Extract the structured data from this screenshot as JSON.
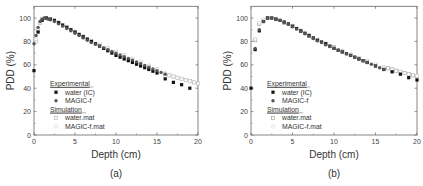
{
  "chart_data": [
    {
      "type": "scatter",
      "panel_label": "(a)",
      "title": "",
      "xlabel": "Depth (cm)",
      "ylabel": "PDD (%)",
      "xlim": [
        0,
        20
      ],
      "ylim": [
        0,
        110
      ],
      "xticks": [
        0,
        5,
        10,
        15,
        20
      ],
      "yticks": [
        0,
        20,
        40,
        60,
        80,
        100
      ],
      "grid": false,
      "legend_position": "lower left",
      "legend": {
        "groups": [
          {
            "heading": "Experimental",
            "entries": [
              "water (IC)",
              "MAGIC-f"
            ]
          },
          {
            "heading": "Simulation",
            "entries": [
              "water.mat",
              "MAGIC-f.mat"
            ]
          }
        ]
      },
      "series": [
        {
          "name": "water (IC)",
          "group": "Experimental",
          "marker": "filled-square",
          "color": "#111111",
          "x": [
            0,
            0.5,
            1,
            1.5,
            2,
            2.5,
            3,
            3.5,
            4,
            4.5,
            5,
            5.5,
            6,
            6.5,
            7,
            7.5,
            8,
            8.5,
            9,
            9.5,
            10,
            10.5,
            11,
            11.5,
            12,
            12.5,
            13,
            13.5,
            14,
            14.5,
            15,
            16,
            17,
            18,
            19
          ],
          "y": [
            55,
            88,
            98,
            100,
            99,
            98,
            96,
            94,
            92,
            90,
            88,
            86,
            84,
            82,
            80,
            78,
            76,
            74,
            72,
            70,
            68,
            66.5,
            65,
            63.5,
            62,
            60.5,
            59,
            57.5,
            56,
            54.5,
            53,
            48,
            45,
            43,
            40
          ]
        },
        {
          "name": "MAGIC-f",
          "group": "Experimental",
          "marker": "filled-circle",
          "color": "#555555",
          "x": [
            0,
            0.25,
            0.5,
            0.75,
            1,
            1.25,
            1.5,
            1.75,
            2,
            2.5,
            3,
            3.5,
            4,
            4.5,
            5,
            5.5,
            6,
            6.5,
            7,
            7.5,
            8,
            8.5,
            9,
            9.5,
            10,
            10.5,
            11,
            11.5,
            12,
            12.5,
            13,
            13.5,
            14,
            14.5,
            15,
            15.5,
            16
          ],
          "y": [
            78,
            85,
            92,
            97,
            99,
            100,
            99.5,
            99,
            98.5,
            97,
            95,
            93,
            91,
            89,
            87,
            85,
            83,
            81,
            79,
            77.5,
            76,
            74.5,
            73,
            71.5,
            70,
            68.5,
            67,
            65.5,
            64,
            62.5,
            61,
            59.5,
            58,
            56.5,
            55,
            53.5,
            52
          ]
        },
        {
          "name": "water.mat",
          "group": "Simulation",
          "marker": "open-square",
          "color": "#aaaaaa",
          "x": [
            0.25,
            0.5,
            0.75,
            1,
            1.5,
            2,
            3,
            4,
            5,
            6,
            7,
            8,
            9,
            10,
            11,
            12,
            13,
            14,
            15,
            16,
            16.5,
            17,
            17.5,
            18,
            18.5,
            19,
            19.5,
            20
          ],
          "y": [
            80,
            90,
            96,
            99,
            100,
            99,
            96,
            92,
            88,
            84,
            80,
            77,
            74,
            71,
            68,
            65,
            62,
            59,
            56,
            52,
            51,
            50,
            49,
            48,
            47,
            46,
            45,
            44
          ]
        },
        {
          "name": "MAGIC-f.mat",
          "group": "Simulation",
          "marker": "open-circle",
          "color": "#cccccc",
          "x": [
            0.25,
            0.5,
            0.75,
            1,
            1.5,
            2,
            3,
            4,
            5,
            6,
            7,
            8,
            9,
            10,
            11,
            12,
            13,
            14,
            15,
            16,
            17,
            18,
            19,
            20
          ],
          "y": [
            82,
            91,
            97,
            99.5,
            100,
            99,
            96,
            92.5,
            88.5,
            84.5,
            81,
            77.5,
            74.5,
            71.5,
            68.5,
            65.5,
            62.5,
            59.5,
            56.5,
            53,
            50,
            48,
            46,
            44
          ]
        }
      ]
    },
    {
      "type": "scatter",
      "panel_label": "(b)",
      "title": "",
      "xlabel": "Depth (cm)",
      "ylabel": "PDD (%)",
      "xlim": [
        0,
        20
      ],
      "ylim": [
        0,
        110
      ],
      "xticks": [
        0,
        5,
        10,
        15,
        20
      ],
      "yticks": [
        0,
        20,
        40,
        60,
        80,
        100
      ],
      "grid": false,
      "legend_position": "lower left",
      "legend": {
        "groups": [
          {
            "heading": "Experimental",
            "entries": [
              "water (IC)",
              "MAGIC-f"
            ]
          },
          {
            "heading": "Simulation",
            "entries": [
              "water.mat",
              "MAGIC-f.mat"
            ]
          }
        ]
      },
      "series": [
        {
          "name": "water (IC)",
          "group": "Experimental",
          "marker": "filled-square",
          "color": "#111111",
          "x": [
            0,
            0.5,
            1,
            1.5,
            2,
            2.5,
            3,
            3.5,
            4,
            4.5,
            5,
            5.5,
            6,
            6.5,
            7,
            7.5,
            8,
            8.5,
            9,
            9.5,
            10,
            10.5,
            11,
            11.5,
            12,
            12.5,
            13,
            13.5,
            14,
            15,
            16,
            17,
            18,
            19,
            20
          ],
          "y": [
            40,
            73,
            89,
            97,
            100,
            100,
            99,
            98,
            96.5,
            95,
            93,
            91,
            89,
            87,
            85,
            83,
            81,
            79.5,
            78,
            76,
            74,
            72.5,
            71,
            69.5,
            68,
            66.5,
            65,
            63.5,
            62,
            59,
            56,
            54,
            52,
            49,
            47
          ]
        },
        {
          "name": "MAGIC-f",
          "group": "Experimental",
          "marker": "filled-circle",
          "color": "#555555",
          "x": [
            0.5,
            1,
            1.5,
            2,
            2.5,
            3,
            3.5,
            4,
            4.5,
            5,
            5.5,
            6,
            6.5,
            7,
            7.5,
            8,
            8.5,
            9,
            9.5,
            10,
            10.5,
            11,
            11.5,
            12,
            12.5,
            13,
            13.5,
            14,
            14.5,
            15,
            15.5,
            16
          ],
          "y": [
            74,
            90,
            97,
            100,
            100,
            99,
            98,
            96.5,
            94.5,
            92.5,
            90.5,
            88.5,
            86.5,
            84.5,
            82.5,
            80.5,
            79,
            77,
            75.5,
            74,
            72.5,
            71,
            69.5,
            68,
            66.5,
            65,
            63.5,
            62,
            60.5,
            59,
            57.5,
            56
          ]
        },
        {
          "name": "water.mat",
          "group": "Simulation",
          "marker": "open-square",
          "color": "#999999",
          "x": [
            0.5,
            1,
            1.5,
            2,
            3,
            4,
            5,
            6,
            7,
            8,
            9,
            10,
            11,
            12,
            13,
            14,
            15,
            16,
            16.5,
            17,
            17.5,
            18,
            18.5,
            19,
            19.5,
            20
          ],
          "y": [
            81,
            95,
            98,
            100,
            99,
            96,
            93,
            89,
            85,
            81,
            78,
            75,
            71.5,
            68.5,
            65.5,
            63,
            60,
            57.5,
            57,
            56,
            55,
            54,
            53,
            52,
            51,
            50
          ]
        },
        {
          "name": "MAGIC-f.mat",
          "group": "Simulation",
          "marker": "open-circle",
          "color": "#cccccc",
          "x": [
            0.5,
            1,
            1.5,
            2,
            3,
            4,
            5,
            6,
            7,
            8,
            9,
            10,
            11,
            12,
            13,
            14,
            15,
            16,
            17,
            18,
            19,
            20
          ],
          "y": [
            82,
            96,
            99,
            100,
            99,
            96.5,
            93.5,
            89.5,
            85.5,
            82,
            78.5,
            75,
            72,
            69,
            66,
            63.5,
            60.5,
            58,
            56,
            54,
            52,
            50.5
          ]
        }
      ]
    }
  ]
}
